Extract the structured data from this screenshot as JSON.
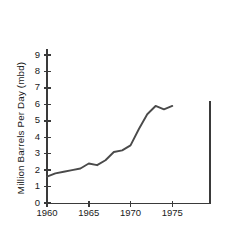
{
  "chart_data": {
    "type": "line",
    "title": "",
    "xlabel": "",
    "ylabel": "Million Barrels Per Day (mbd)",
    "xlim": [
      1960,
      1975
    ],
    "ylim": [
      0,
      9
    ],
    "grid": false,
    "legend": null,
    "x_ticks": [
      "1960",
      "1965",
      "1970",
      "1975"
    ],
    "x_tick_values": [
      1960,
      1965,
      1970,
      1975
    ],
    "y_ticks": [
      "0",
      "1",
      "2",
      "3",
      "4",
      "5",
      "6",
      "7",
      "8",
      "9"
    ],
    "y_tick_values": [
      0,
      1,
      2,
      3,
      4,
      5,
      6,
      7,
      8,
      9
    ],
    "series": [
      {
        "name": "Imports",
        "x": [
          1960,
          1961,
          1962,
          1963,
          1964,
          1965,
          1966,
          1967,
          1968,
          1969,
          1970,
          1971,
          1972,
          1973,
          1974,
          1975
        ],
        "values": [
          1.6,
          1.8,
          1.9,
          2.0,
          2.1,
          2.4,
          2.3,
          2.6,
          3.1,
          3.2,
          3.5,
          4.5,
          5.4,
          5.9,
          5.7,
          5.9
        ]
      }
    ],
    "annotations": [
      {
        "name": "right-vertical-rule",
        "type": "vline",
        "x": 1979.5,
        "y_from": 0,
        "y_to": 6.2
      }
    ]
  },
  "axes": {
    "y_axis_name": "y-axis",
    "x_axis_name": "x-axis"
  }
}
